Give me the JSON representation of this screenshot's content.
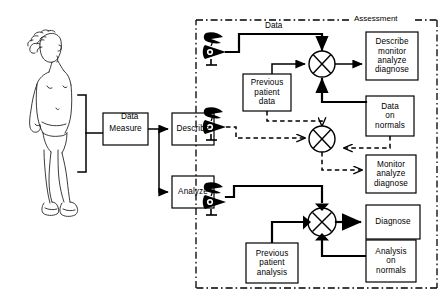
{
  "diagram": {
    "panel": {
      "label": "Assessment"
    },
    "left_flow": {
      "subject_icon": "standing-toddler-figure",
      "bracket": "measurement-bracket",
      "measure_box": "Measure",
      "data_label": "Data",
      "describe_box": "Describe",
      "analyze_box": "Analyze"
    },
    "rows": [
      {
        "id": "row-describe",
        "observer_icon": "observer-eye-icon",
        "data_label": "Data",
        "previous_box": "Previous\npatient\ndata",
        "previous_lines": [
          "Previous",
          "patient",
          "data"
        ],
        "comparator": "crossed-circle-comparator",
        "output_lines": [
          "Describe",
          "monitor",
          "analyze",
          "diagnose"
        ],
        "line_style": "solid"
      },
      {
        "id": "row-monitor",
        "observer_icon": "observer-eye-icon",
        "reference_lines": [
          "Data",
          "on",
          "normals"
        ],
        "comparator": "crossed-circle-comparator",
        "output_lines": [
          "Monitor",
          "analyze",
          "diagnose"
        ],
        "line_style": "dashed"
      },
      {
        "id": "row-diagnose",
        "observer_icon": "observer-eye-icon",
        "previous_lines": [
          "Previous",
          "patient",
          "analysis"
        ],
        "reference_lines": [
          "Analysis",
          "on",
          "normals"
        ],
        "comparator": "filled-arrow-comparator",
        "output_lines": [
          "Diagnose"
        ],
        "line_style": "solid-bold"
      }
    ],
    "colors": {
      "ink": "#000000",
      "paper": "#ffffff"
    }
  }
}
